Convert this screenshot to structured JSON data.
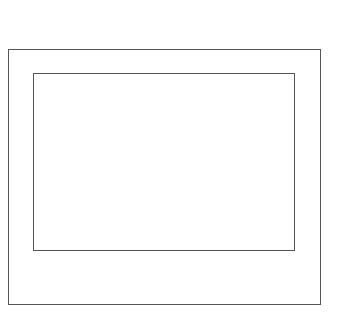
{
  "diagram": {
    "shapes": [
      {
        "name": "outer-rectangle",
        "x": 8,
        "y": 49,
        "width": 313,
        "height": 256,
        "stroke": "#555555"
      },
      {
        "name": "inner-rectangle",
        "x": 33,
        "y": 73,
        "width": 262,
        "height": 178,
        "stroke": "#555555"
      }
    ]
  }
}
